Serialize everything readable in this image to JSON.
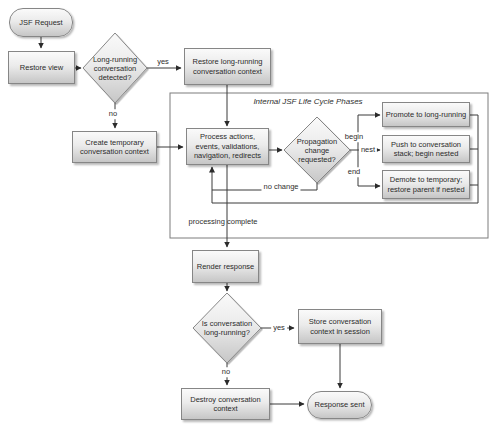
{
  "diagram": {
    "frame_title": "Internal JSF Life Cycle Phases",
    "nodes": {
      "jsf_request": "JSF Request",
      "restore_view": "Restore view",
      "long_running_detected": "Long-running conversation detected?",
      "restore_long_running": "Restore long-running conversation context",
      "create_temporary": "Create temporary conversation context",
      "process_actions": "Process actions, events, validations, navigation, redirects",
      "propagation_change": "Propagation change requested?",
      "promote": "Promote to long-running",
      "push": "Push to conversation stack; begin nested",
      "demote": "Demote to temporary; restore parent if nested",
      "render_response": "Render response",
      "is_long_running": "Is conversation long-running?",
      "store_context": "Store conversation context in session",
      "destroy_context": "Destroy conversation context",
      "response_sent": "Response sent"
    },
    "edge_labels": {
      "yes_top": "yes",
      "no_top": "no",
      "begin": "begin",
      "nest": "nest",
      "end": "end",
      "no_change": "no change",
      "processing_complete": "processing complete",
      "yes_bottom": "yes",
      "no_bottom": "no"
    },
    "colors": {
      "node_fill_top": "#fafafa",
      "node_fill_bottom": "#c6c6c6",
      "node_border": "#868686",
      "connector": "#3a3a3a",
      "text": "#2e2e2e",
      "background": "#ffffff"
    }
  }
}
